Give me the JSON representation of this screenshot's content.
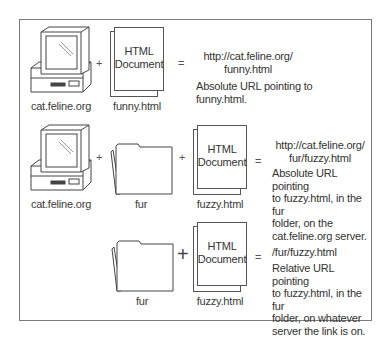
{
  "diagram": {
    "rows": [
      {
        "server_label": "cat.feline.org",
        "plus_1": "+",
        "document": {
          "title_line1": "HTML",
          "title_line2": "Document",
          "file_label": "funny.html"
        },
        "equals": "=",
        "url_line1": "http://cat.feline.org/",
        "url_line2": "funny.html",
        "description": [
          "Absolute URL pointing to",
          "funny.html."
        ]
      },
      {
        "server_label": "cat.feline.org",
        "plus_1": "+",
        "folder_label": "fur",
        "plus_2": "+",
        "document": {
          "title_line1": "HTML",
          "title_line2": "Document",
          "file_label": "fuzzy.html"
        },
        "equals": "=",
        "url_line1": "http://cat.feline.org/",
        "url_line2": "fur/fuzzy.html",
        "description": [
          "Absolute URL pointing",
          "to fuzzy.html, in the fur",
          "folder, on the",
          "cat.feline.org server."
        ]
      },
      {
        "folder_label": "fur",
        "plus_2": "+",
        "document": {
          "title_line1": "HTML",
          "title_line2": "Document",
          "file_label": "fuzzy.html"
        },
        "equals": "=",
        "url_line1": "/fur/fuzzy.html",
        "description": [
          "Relative URL pointing",
          "to fuzzy.html, in the fur",
          "folder, on whatever",
          "server the link is on."
        ]
      }
    ],
    "icons": {
      "server": "computer-icon",
      "folder": "folder-icon",
      "document": "html-document-icon"
    }
  }
}
